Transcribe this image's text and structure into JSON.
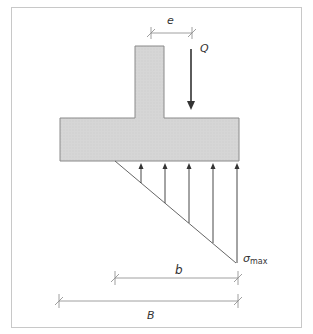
{
  "diagram": {
    "labels": {
      "eccentricity": "e",
      "load": "Q",
      "sigma": "σ",
      "sigma_sub": "max",
      "effective_width": "b",
      "full_width": "B"
    },
    "colors": {
      "border": "#c8c8c8",
      "concrete_fill": "#d4d4d4",
      "concrete_stroke": "#8a8a8a",
      "line": "#555555",
      "arrow": "#333333",
      "dim_line": "#888888"
    },
    "pressure_arrows_count": 5
  }
}
